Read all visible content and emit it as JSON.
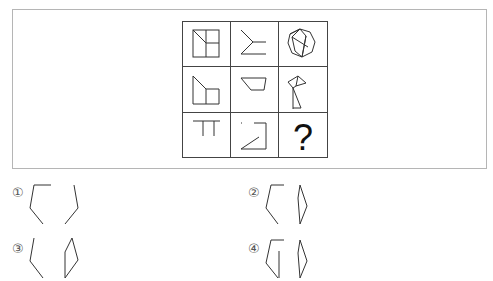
{
  "puzzle": {
    "type": "3x3 figure reasoning matrix",
    "cells": [
      {
        "row": 1,
        "col": 1,
        "figure": "square-with-cross-and-diagonal"
      },
      {
        "row": 1,
        "col": 2,
        "figure": "y-shape-open"
      },
      {
        "row": 1,
        "col": 3,
        "figure": "heptagon-with-inner-lines"
      },
      {
        "row": 2,
        "col": 1,
        "figure": "pentagon-with-square"
      },
      {
        "row": 2,
        "col": 2,
        "figure": "trapezoid"
      },
      {
        "row": 2,
        "col": 3,
        "figure": "flag-shape"
      },
      {
        "row": 3,
        "col": 1,
        "figure": "pi-shape"
      },
      {
        "row": 3,
        "col": 2,
        "figure": "z-like-shape"
      },
      {
        "row": 3,
        "col": 3,
        "figure": "unknown",
        "text": "?"
      }
    ]
  },
  "options": [
    {
      "label": "①",
      "figure": "two-open-polylines"
    },
    {
      "label": "②",
      "figure": "open-polyline-and-quadrilateral"
    },
    {
      "label": "③",
      "figure": "short-polyline-and-quadrilateral"
    },
    {
      "label": "④",
      "figure": "open-polyline-with-stem-and-quadrilateral"
    }
  ]
}
